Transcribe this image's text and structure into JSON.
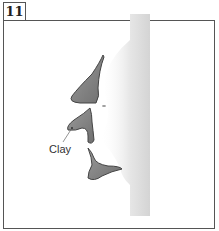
{
  "step_number": "11",
  "labels": {
    "clay": "Clay"
  },
  "colors": {
    "clay_fill": "#8a8a8a",
    "clay_stroke": "#444444",
    "face_shade": "#cfcfcf",
    "border": "#555555"
  }
}
